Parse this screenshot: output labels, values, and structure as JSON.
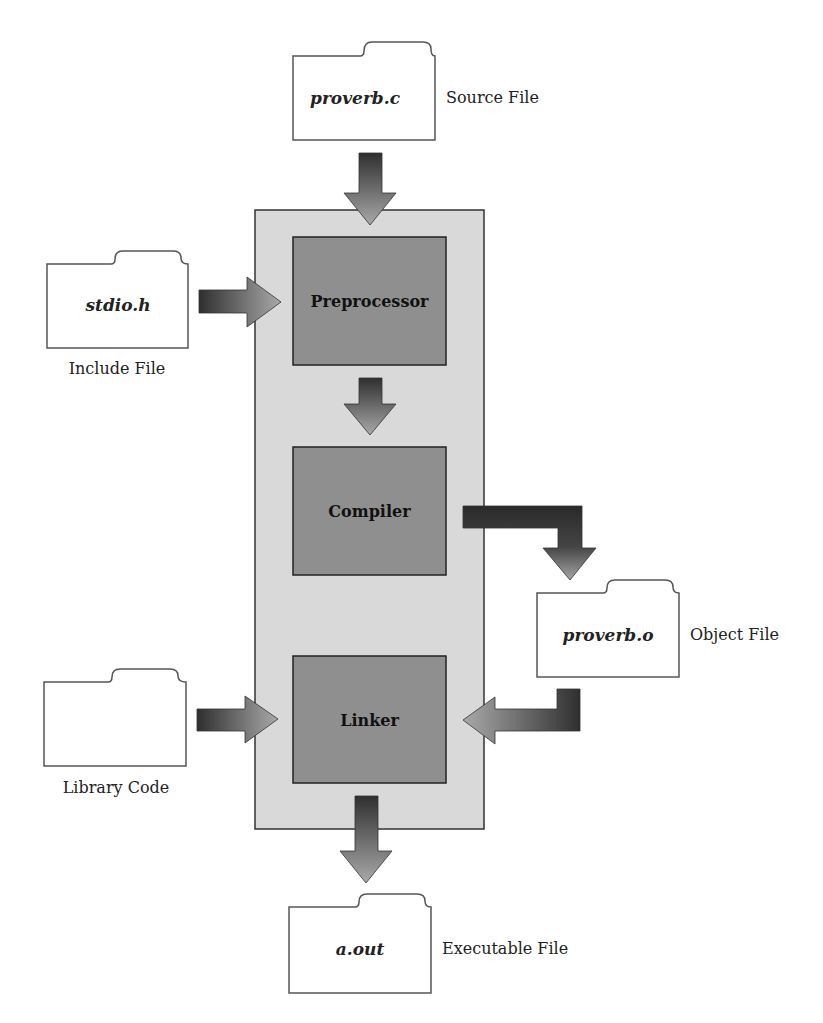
{
  "diagram": {
    "stages": {
      "preprocessor": "Preprocessor",
      "compiler": "Compiler",
      "linker": "Linker"
    },
    "files": {
      "source": {
        "name": "proverb.c",
        "caption": "Source File"
      },
      "include": {
        "name": "stdio.h",
        "caption": "Include File"
      },
      "object": {
        "name": "proverb.o",
        "caption": "Object File"
      },
      "library": {
        "name": "",
        "caption": "Library Code"
      },
      "executable": {
        "name": "a.out",
        "caption": "Executable File"
      }
    },
    "colors": {
      "outer_panel": "#d9d9d9",
      "stage_box": "#8f8f8f",
      "arrow_dark": "#3a3a3a",
      "arrow_light": "#a8a8a8",
      "outline": "#333333"
    }
  }
}
